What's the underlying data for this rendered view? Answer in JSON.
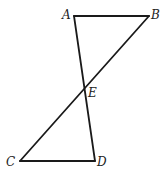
{
  "diagram": {
    "type": "geometry",
    "stroke_color": "#1a1a1a",
    "points": {
      "A": {
        "label": "A",
        "x": 74,
        "y": 16
      },
      "B": {
        "label": "B",
        "x": 149,
        "y": 16
      },
      "E": {
        "label": "E",
        "x": 85,
        "y": 89
      },
      "C": {
        "label": "C",
        "x": 20,
        "y": 161
      },
      "D": {
        "label": "D",
        "x": 95,
        "y": 161
      }
    },
    "segments": [
      {
        "name": "AB",
        "from": "A",
        "to": "B"
      },
      {
        "name": "AD",
        "from": "A",
        "to": "D"
      },
      {
        "name": "BC",
        "from": "B",
        "to": "C"
      },
      {
        "name": "CD",
        "from": "C",
        "to": "D"
      }
    ],
    "labels": {
      "A": "A",
      "B": "B",
      "C": "C",
      "D": "D",
      "E": "E"
    }
  }
}
